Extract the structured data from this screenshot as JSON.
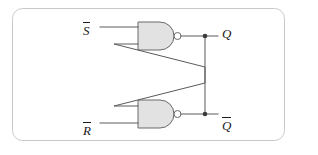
{
  "figure": {
    "kind": "logic-circuit-diagram",
    "name": "SR latch built from two cross-coupled NAND gates",
    "canvas": {
      "width": 318,
      "height": 155,
      "background": "#ffffff"
    },
    "border": {
      "shape": "rounded-rectangle",
      "color": "#c9c9c9",
      "corner_radius": 10
    }
  },
  "colors": {
    "wire": "#5a5a5a",
    "gate_fill": "#e2e2e2",
    "gate_outline": "#6a6a6a",
    "bubble_fill": "#ffffff",
    "junction_dot": "#3a3a3a",
    "label_text": "#1a1a1a",
    "border": "#c9c9c9"
  },
  "inputs": [
    {
      "id": "s-bar",
      "base": "S",
      "overline": true,
      "label": "S",
      "position": "top-left"
    },
    {
      "id": "r-bar",
      "base": "R",
      "overline": true,
      "label": "R",
      "position": "bottom-left"
    }
  ],
  "outputs": [
    {
      "id": "q",
      "base": "Q",
      "overline": false,
      "label": "Q",
      "position": "top-right"
    },
    {
      "id": "q-bar",
      "base": "Q",
      "overline": true,
      "label": "Q",
      "position": "bottom-right"
    }
  ],
  "gates": [
    {
      "id": "nand-top",
      "type": "NAND",
      "inputs": [
        "s-bar",
        "feedback-from-q-bar"
      ],
      "output": "q",
      "has_output_bubble": true
    },
    {
      "id": "nand-bottom",
      "type": "NAND",
      "inputs": [
        "feedback-from-q",
        "r-bar"
      ],
      "output": "q-bar",
      "has_output_bubble": true
    }
  ],
  "connections": [
    {
      "id": "wire-s-in",
      "from": "s-bar",
      "to": "nand-top.input-1"
    },
    {
      "id": "wire-r-in",
      "from": "r-bar",
      "to": "nand-bottom.input-2"
    },
    {
      "id": "wire-q-out",
      "from": "nand-top.output",
      "to": "q"
    },
    {
      "id": "wire-qbar-out",
      "from": "nand-bottom.output",
      "to": "q-bar"
    },
    {
      "id": "wire-cross-q",
      "from": "q-node",
      "to": "nand-bottom.input-1",
      "style": "diagonal-cross"
    },
    {
      "id": "wire-cross-qbar",
      "from": "q-bar-node",
      "to": "nand-top.input-2",
      "style": "diagonal-cross"
    }
  ],
  "junctions": [
    {
      "id": "junction-q",
      "on": "q-output-line"
    },
    {
      "id": "junction-q-bar",
      "on": "q-bar-output-line"
    }
  ]
}
